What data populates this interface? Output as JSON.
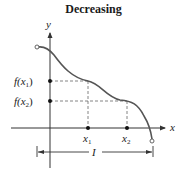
{
  "title": "Decreasing",
  "axes": {
    "x_label": "x",
    "y_label": "y"
  },
  "points": {
    "x1": {
      "label": "x",
      "sub": "1"
    },
    "x2": {
      "label": "x",
      "sub": "2"
    },
    "fx1": {
      "label": "f(x",
      "sub": "1",
      "close": ")"
    },
    "fx2": {
      "label": "f(x",
      "sub": "2",
      "close": ")"
    }
  },
  "interval": {
    "label": "I"
  },
  "colors": {
    "curve": "#555555",
    "axis": "#333333",
    "dashed": "#666666"
  }
}
